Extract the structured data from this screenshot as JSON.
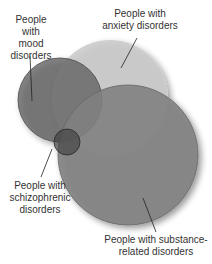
{
  "diagram": {
    "type": "venn",
    "sets": [
      {
        "id": "mood",
        "label_lines": [
          "People with",
          "mood",
          "disorders"
        ],
        "color": "#6e6e6e"
      },
      {
        "id": "anxiety",
        "label_lines": [
          "People with",
          "anxiety disorders"
        ],
        "color": "#c4c4c4"
      },
      {
        "id": "substance",
        "label_lines": [
          "People with substance-",
          "related disorders"
        ],
        "color": "#8a8a8a"
      },
      {
        "id": "schizophrenic",
        "label_lines": [
          "People with",
          "schizophrenic",
          "disorders"
        ],
        "color": "#4a4a4a"
      }
    ]
  }
}
